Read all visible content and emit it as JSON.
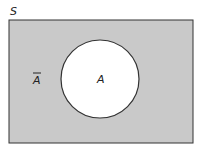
{
  "diagram": {
    "type": "venn",
    "sample_space_label": "S",
    "set_label": "A",
    "complement_label": "A",
    "complement_bar": true,
    "colors": {
      "complement_fill": "#c9c9c9",
      "set_fill": "#ffffff",
      "stroke": "#333333"
    }
  }
}
